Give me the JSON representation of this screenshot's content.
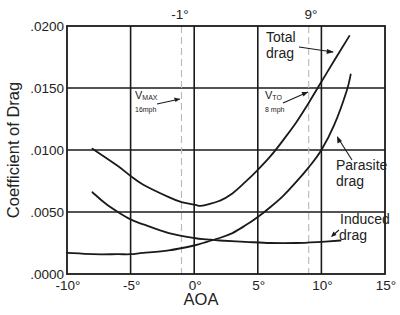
{
  "chart_data": {
    "type": "line",
    "title": "",
    "xlabel": "AOA",
    "ylabel": "Coefficient of Drag",
    "xlim": [
      -10,
      15
    ],
    "ylim": [
      0.0,
      0.02
    ],
    "grid": true,
    "legend": "none (inline curve labels)",
    "x_ticks": [
      -10,
      -5,
      0,
      5,
      10,
      15
    ],
    "x_tick_labels": [
      "-10°",
      "-5°",
      "0°",
      "5°",
      "10°",
      "15°"
    ],
    "y_ticks": [
      0.0,
      0.005,
      0.01,
      0.015,
      0.02
    ],
    "y_tick_labels": [
      ".0000",
      ".0050",
      ".0100",
      ".0150",
      ".0200"
    ],
    "series": [
      {
        "name": "Total drag",
        "x": [
          -8,
          -6,
          -5,
          -4,
          -2,
          -1,
          0,
          0.5,
          1,
          2,
          3,
          4,
          5,
          6,
          7,
          8,
          9,
          10,
          11,
          12.2
        ],
        "y": [
          0.0101,
          0.0087,
          0.0079,
          0.0072,
          0.0062,
          0.0058,
          0.0056,
          0.0055,
          0.0056,
          0.0059,
          0.0065,
          0.0074,
          0.0084,
          0.0095,
          0.0108,
          0.0122,
          0.0138,
          0.0155,
          0.0172,
          0.0192
        ]
      },
      {
        "name": "Parasite drag",
        "x": [
          -10,
          -8,
          -6,
          -5,
          -4,
          -2,
          0,
          1,
          2,
          3,
          4,
          5,
          6,
          7,
          8,
          9,
          10,
          11,
          12,
          12.3
        ],
        "y": [
          0.0017,
          0.0016,
          0.0016,
          0.0016,
          0.0017,
          0.0019,
          0.0023,
          0.0026,
          0.0029,
          0.0033,
          0.0039,
          0.0046,
          0.0054,
          0.0063,
          0.0074,
          0.0086,
          0.01,
          0.012,
          0.0148,
          0.0161
        ]
      },
      {
        "name": "Induced drag",
        "x": [
          -8,
          -7,
          -6,
          -5,
          -4,
          -2,
          0,
          1,
          2,
          4,
          6,
          8,
          10,
          11.5
        ],
        "y": [
          0.0066,
          0.0057,
          0.005,
          0.0044,
          0.004,
          0.0033,
          0.0029,
          0.0028,
          0.0027,
          0.0026,
          0.0025,
          0.0025,
          0.0026,
          0.0027
        ]
      }
    ],
    "reference_lines": [
      {
        "x": -1,
        "label": "-1°",
        "style": "dashed",
        "annotation": "V_MAX",
        "annotation_sub": "MAX",
        "annotation_main": "V",
        "note": "16mph"
      },
      {
        "x": 9,
        "label": "9°",
        "style": "dashed",
        "annotation": "V_TO",
        "annotation_sub": "TO",
        "annotation_main": "V",
        "note": "8 mph"
      }
    ],
    "annotations": [
      {
        "text_line1": "Total",
        "text_line2": "drag",
        "points_to": "Total drag"
      },
      {
        "text_line1": "Parasite",
        "text_line2": "drag",
        "points_to": "Parasite drag"
      },
      {
        "text_line1": "Induced",
        "text_line2": "drag",
        "points_to": "Induced drag"
      }
    ]
  },
  "colors": {
    "curve": "#1a1a1a",
    "grid": "#1a1a1a",
    "reference_line": "#b8b8b8",
    "background": "#ffffff"
  }
}
